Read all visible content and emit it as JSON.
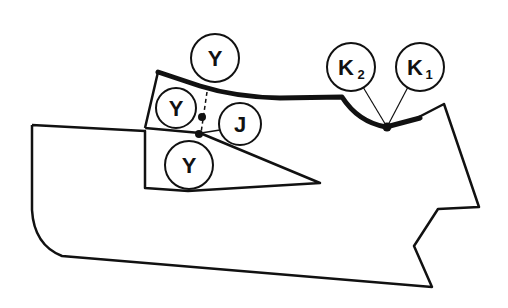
{
  "diagram": {
    "colors": {
      "stroke": "#111111",
      "background": "#ffffff"
    },
    "labels": {
      "y_top": "Y",
      "y_left": "Y",
      "j": "J",
      "y_bottom": "Y",
      "k2": "K",
      "k2_sub": "2",
      "k1": "K",
      "k1_sub": "1"
    }
  }
}
